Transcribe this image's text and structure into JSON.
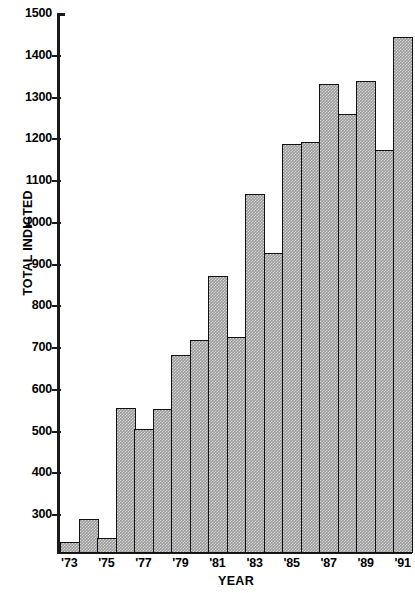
{
  "chart_data": {
    "type": "bar",
    "title": "",
    "xlabel": "YEAR",
    "ylabel": "TOTAL INDICTED",
    "ylim": [
      207,
      1500
    ],
    "y_axis_min_label": 300,
    "y_axis_max_label": 1500,
    "y_tick_step": 100,
    "grid": false,
    "legend": null,
    "bar_fill": "#9a9a9a",
    "bar_edge": "#111111",
    "axis_color": "#1a1a1a",
    "background": "#ffffff",
    "categories": [
      "1973",
      "1974",
      "1975",
      "1976",
      "1977",
      "1978",
      "1979",
      "1980",
      "1981",
      "1982",
      "1983",
      "1984",
      "1985",
      "1986",
      "1987",
      "1988",
      "1989",
      "1990",
      "1991"
    ],
    "tick_labels": [
      "'73",
      "'75",
      "'77",
      "'79",
      "'81",
      "'83",
      "'85",
      "'87",
      "'89",
      "'91"
    ],
    "tick_label_categories": [
      "1973",
      "1975",
      "1977",
      "1979",
      "1981",
      "1983",
      "1985",
      "1987",
      "1989",
      "1991"
    ],
    "values": [
      240,
      295,
      250,
      560,
      510,
      558,
      688,
      725,
      877,
      730,
      1073,
      932,
      1193,
      1198,
      1338,
      1265,
      1345,
      1180,
      1450
    ],
    "ytick_labels": [
      "1500",
      "1400",
      "1300",
      "1200",
      "1100",
      "1000",
      "900",
      "800",
      "700",
      "600",
      "500",
      "400",
      "300"
    ],
    "ytick_values": [
      1500,
      1400,
      1300,
      1200,
      1100,
      1000,
      900,
      800,
      700,
      600,
      500,
      400,
      300
    ]
  }
}
